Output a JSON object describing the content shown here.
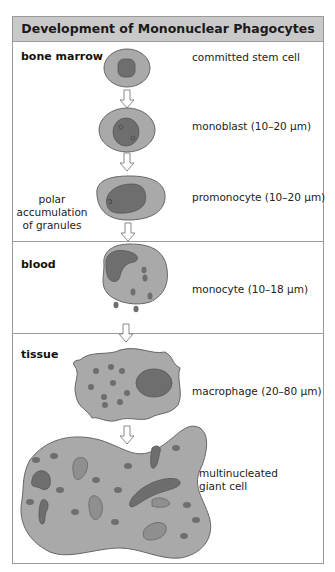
{
  "title": "Development of Mononuclear Phagocytes",
  "colors": {
    "header_bg": "#c9c9c9",
    "frame": "#9a9a9a",
    "cytoplasm": "#a9a9a9",
    "nucleus": "#6e6e6e",
    "granule": "#6e6e6e",
    "phagosome": "#8f8f8f"
  },
  "sections": [
    {
      "label": "bone marrow"
    },
    {
      "label": "blood"
    },
    {
      "label": "tissue"
    }
  ],
  "stages": [
    {
      "label": "committed stem cell"
    },
    {
      "label": "monoblast (10–20 μm)"
    },
    {
      "label": "promonocyte (10–20 μm)"
    },
    {
      "label": "monocyte (10–18 μm)"
    },
    {
      "label": "macrophage (20–80 μm)"
    },
    {
      "label_line1": "multinucleated",
      "label_line2": "giant cell"
    }
  ],
  "annotation": {
    "line1": "polar",
    "line2": "accumulation",
    "line3": "of granules"
  }
}
